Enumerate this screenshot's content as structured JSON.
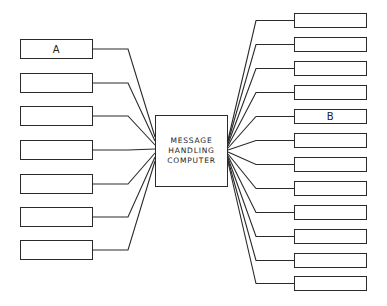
{
  "center": {
    "lines": [
      "MESSAGE",
      "HANDLING",
      "COMPUTER"
    ]
  },
  "left_terminals": [
    {
      "label": "A",
      "y": 39
    },
    {
      "label": "",
      "y": 73
    },
    {
      "label": "",
      "y": 106
    },
    {
      "label": "",
      "y": 140
    },
    {
      "label": "",
      "y": 174
    },
    {
      "label": "",
      "y": 207
    },
    {
      "label": "",
      "y": 240
    }
  ],
  "right_terminals": [
    {
      "label": "",
      "y": 13
    },
    {
      "label": "",
      "y": 37
    },
    {
      "label": "",
      "y": 61
    },
    {
      "label": "",
      "y": 85
    },
    {
      "label": "B",
      "y": 109
    },
    {
      "label": "",
      "y": 133
    },
    {
      "label": "",
      "y": 157
    },
    {
      "label": "",
      "y": 181
    },
    {
      "label": "",
      "y": 205
    },
    {
      "label": "",
      "y": 229
    },
    {
      "label": "",
      "y": 253
    },
    {
      "label": "",
      "y": 276
    }
  ],
  "colors": {
    "line": "#2a2a2a",
    "background": "#ffffff"
  }
}
